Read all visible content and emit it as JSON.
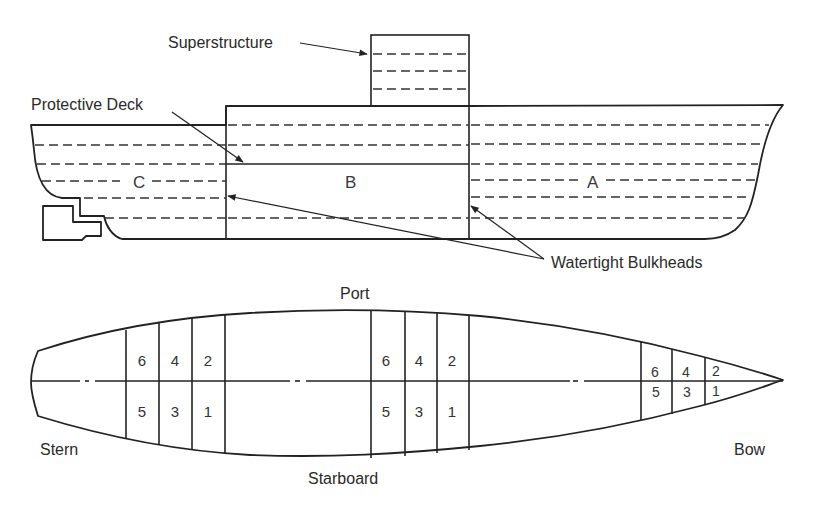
{
  "side_view": {
    "labels": {
      "superstructure": "Superstructure",
      "protective_deck": "Protective Deck",
      "watertight_bulkheads": "Watertight Bulkheads"
    },
    "sections": [
      "C",
      "B",
      "A"
    ]
  },
  "plan_view": {
    "labels": {
      "port": "Port",
      "starboard": "Starboard",
      "stern": "Stern",
      "bow": "Bow"
    },
    "compartment_groups": [
      {
        "top": [
          "6",
          "4",
          "2"
        ],
        "bottom": [
          "5",
          "3",
          "1"
        ]
      },
      {
        "top": [
          "6",
          "4",
          "2"
        ],
        "bottom": [
          "5",
          "3",
          "1"
        ]
      },
      {
        "top": [
          "6",
          "4",
          "2"
        ],
        "bottom": [
          "5",
          "3",
          "1"
        ]
      }
    ]
  }
}
